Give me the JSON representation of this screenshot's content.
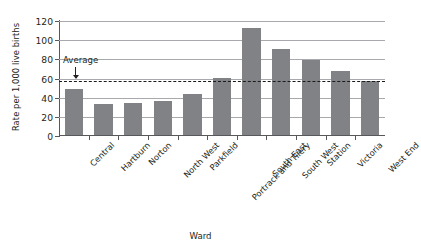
{
  "chart_data": {
    "type": "bar",
    "title": "",
    "xlabel": "Ward",
    "ylabel": "Rate per 1,000 live births",
    "categories": [
      "Central",
      "Hartburn",
      "Norton",
      "North West",
      "Parkfield",
      "Portrack and Tilery",
      "South East",
      "South West",
      "Station",
      "Victoria",
      "West End"
    ],
    "values": [
      48,
      32,
      33,
      36,
      43,
      60,
      112,
      90,
      78,
      67,
      56
    ],
    "ylim": [
      0,
      120
    ],
    "yticks": [
      0,
      20,
      40,
      60,
      80,
      100,
      120
    ],
    "ytick_labels": [
      "0",
      "20",
      "40",
      "60",
      "80",
      "100",
      "120"
    ],
    "grid": true,
    "legend": "none",
    "bar_color": "#808285",
    "gridline_color": "#a7a9ac",
    "axis_color": "#58585b",
    "annotations": [
      {
        "name": "average-line",
        "label": "Average",
        "value": 57,
        "style": "dashed",
        "color": "#1a1a1a"
      }
    ]
  }
}
